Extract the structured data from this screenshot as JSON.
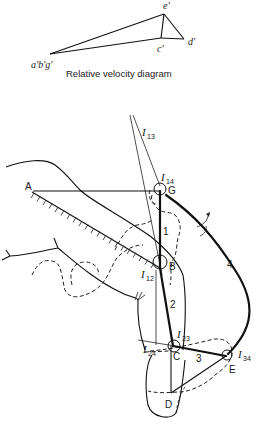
{
  "velocity_diagram": {
    "caption": "Relative velocity diagram",
    "points": {
      "origin": {
        "label": "a'b'g'",
        "x": 50,
        "y": 53
      },
      "c": {
        "label": "c'",
        "x": 161,
        "y": 37
      },
      "d": {
        "label": "d'",
        "x": 184,
        "y": 38
      },
      "e": {
        "label": "e'",
        "x": 164,
        "y": 13
      }
    }
  },
  "mechanism": {
    "joints": {
      "A": {
        "label": "A",
        "x": 33,
        "y": 191
      },
      "G": {
        "label": "G",
        "x": 160,
        "y": 191
      },
      "B": {
        "label": "B",
        "x": 160,
        "y": 268
      },
      "C": {
        "label": "C",
        "x": 175,
        "y": 346
      },
      "D": {
        "label": "D",
        "x": 171,
        "y": 393
      },
      "E": {
        "label": "E",
        "x": 227,
        "y": 355
      }
    },
    "links": [
      {
        "label": "1",
        "x": 165,
        "y": 232
      },
      {
        "label": "2",
        "x": 172,
        "y": 305
      },
      {
        "label": "3",
        "x": 197,
        "y": 359
      },
      {
        "label": "4",
        "x": 230,
        "y": 265
      }
    ],
    "instant_centers": [
      {
        "label": "I",
        "sub": "13",
        "x": 142,
        "y": 134
      },
      {
        "label": "I",
        "sub": "14",
        "x": 162,
        "y": 179
      },
      {
        "label": "I",
        "sub": "12",
        "x": 141,
        "y": 277
      },
      {
        "label": "I",
        "sub": "23",
        "x": 177,
        "y": 337
      },
      {
        "label": "I",
        "sub": "24",
        "x": 143,
        "y": 352
      },
      {
        "label": "I",
        "sub": "34",
        "x": 238,
        "y": 357
      }
    ]
  }
}
